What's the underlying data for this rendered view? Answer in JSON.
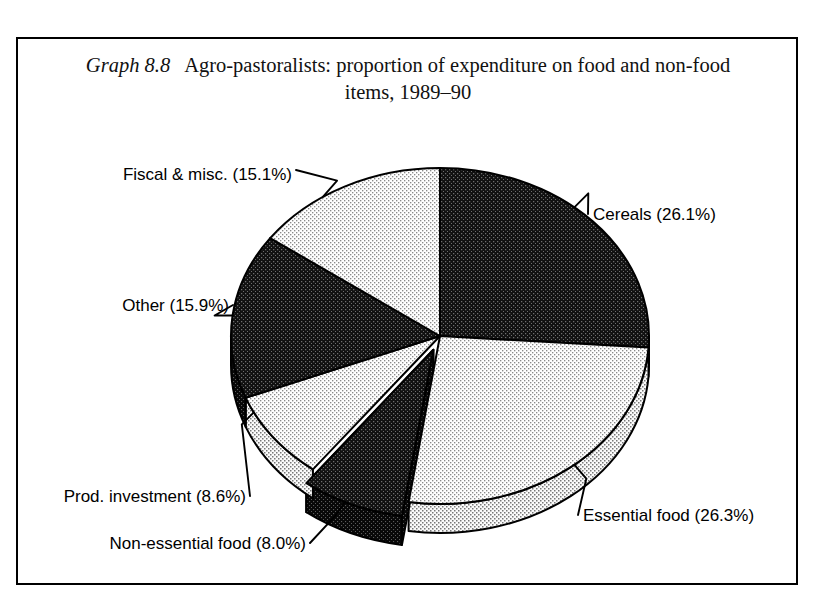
{
  "figure": {
    "graph_number": "Graph 8.8",
    "title": "Agro-pastoralists: proportion of expenditure on food and non-food items, 1989–90",
    "title_line1": "Agro-pastoralists: proportion of expenditure on food and non-food",
    "title_line2": "items, 1989–90",
    "frame_color": "#000000",
    "background_color": "#ffffff"
  },
  "chart_data": {
    "type": "pie",
    "title": "Agro-pastoralists: proportion of expenditure on food and non-food items, 1989–90",
    "xlabel": "",
    "ylabel": "",
    "units": "percent",
    "total": 100.0,
    "three_d": true,
    "start_angle_deg": 0,
    "direction": "clockwise",
    "legend": "none (direct labels with leader lines)",
    "grid": false,
    "categories": [
      "Cereals",
      "Essential food",
      "Non-essential food",
      "Prod. investment",
      "Other",
      "Fiscal & misc."
    ],
    "values": [
      26.1,
      26.3,
      8.0,
      8.6,
      15.9,
      15.1
    ],
    "slices": [
      {
        "key": "cereals",
        "label": "Cereals (26.1%)",
        "name": "Cereals",
        "value": 26.1,
        "fill": "dark",
        "color": "#1a1a1a",
        "exploded": false
      },
      {
        "key": "essential-food",
        "label": "Essential food (26.3%)",
        "name": "Essential food",
        "value": 26.3,
        "fill": "light",
        "color": "#e6e6e6",
        "exploded": false
      },
      {
        "key": "non-essential-food",
        "label": "Non-essential food (8.0%)",
        "name": "Non-essential food",
        "value": 8.0,
        "fill": "dark",
        "color": "#1a1a1a",
        "exploded": true
      },
      {
        "key": "prod-investment",
        "label": "Prod. investment (8.6%)",
        "name": "Prod. investment",
        "value": 8.6,
        "fill": "light",
        "color": "#e6e6e6",
        "exploded": false
      },
      {
        "key": "other",
        "label": "Other (15.9%)",
        "name": "Other",
        "value": 15.9,
        "fill": "dark",
        "color": "#1a1a1a",
        "exploded": false
      },
      {
        "key": "fiscal-misc",
        "label": "Fiscal & misc. (15.1%)",
        "name": "Fiscal & misc.",
        "value": 15.1,
        "fill": "light",
        "color": "#e6e6e6",
        "exploded": false
      }
    ]
  },
  "labels": {
    "cereals": "Cereals (26.1%)",
    "essential_food": "Essential food (26.3%)",
    "non_essential_food": "Non-essential food (8.0%)",
    "prod_investment": "Prod. investment (8.6%)",
    "other": "Other (15.9%)",
    "fiscal_misc": "Fiscal & misc. (15.1%)"
  }
}
